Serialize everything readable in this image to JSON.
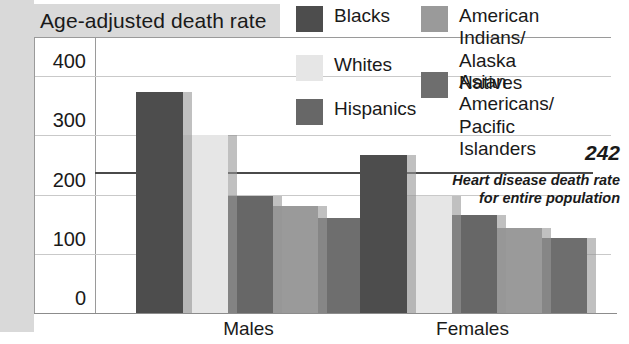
{
  "chart_data": {
    "type": "bar",
    "title": "Age-adjusted death rate",
    "xlabel": "",
    "ylabel": "Age-adjusted death rate",
    "categories": [
      "Males",
      "Females"
    ],
    "ylim": [
      0,
      400
    ],
    "yticks": [
      0,
      100,
      200,
      300,
      400
    ],
    "ytick_labels": [
      "0",
      "100",
      "200",
      "300",
      "400"
    ],
    "grid": true,
    "legend_position": "top-right",
    "series": [
      {
        "name": "Blacks",
        "values": [
          373,
          266
        ],
        "color": "#4d4d4d"
      },
      {
        "name": "Whites",
        "values": [
          300,
          198
        ],
        "color": "#e6e6e6"
      },
      {
        "name": "Hispanics",
        "values": [
          198,
          166
        ],
        "color": "#676767"
      },
      {
        "name": "American Indians/\nAlaska Natives",
        "values": [
          181,
          143
        ],
        "color": "#9a9a9a"
      },
      {
        "name": "Asian Americans/\nPacific Islanders",
        "values": [
          160,
          126
        ],
        "color": "#6e6e6e"
      }
    ],
    "reference_line": {
      "value": 242,
      "label": "242",
      "annotation": "Heart disease death rate for entire population"
    }
  },
  "title": {
    "text": "Age-adjusted death rate"
  },
  "y_axis": {
    "ticks": [
      {
        "label": "400",
        "value": 400
      },
      {
        "label": "300",
        "value": 300
      },
      {
        "label": "200",
        "value": 200
      },
      {
        "label": "100",
        "value": 100
      },
      {
        "label": "0",
        "value": 0
      }
    ]
  },
  "x_axis": {
    "labels": [
      {
        "text": "Males"
      },
      {
        "text": "Females"
      }
    ]
  },
  "legend": {
    "items": [
      {
        "label": "Blacks",
        "color": "#4d4d4d"
      },
      {
        "label": "Whites",
        "color": "#e6e6e6"
      },
      {
        "label": "Hispanics",
        "color": "#676767"
      },
      {
        "label": "American Indians/\nAlaska Natives",
        "color": "#9a9a9a"
      },
      {
        "label": "Asian Americans/\nPacific Islanders",
        "color": "#6e6e6e"
      }
    ]
  },
  "annotation": {
    "value": "242",
    "text": "Heart disease death rate for entire population"
  }
}
